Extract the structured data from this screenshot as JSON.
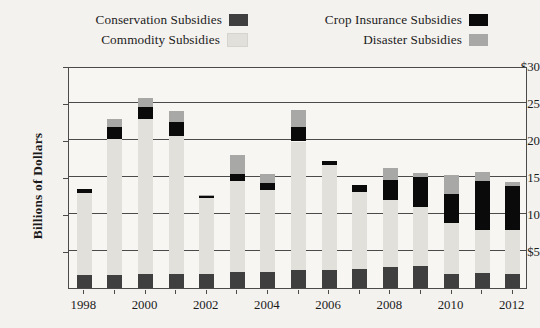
{
  "legend": {
    "entries": [
      {
        "label": "Conservation Subsidies",
        "color": "#3f3f3f",
        "key": "conservation"
      },
      {
        "label": "Crop Insurance Subsidies",
        "color": "#0a0a0a",
        "key": "crop_insurance"
      },
      {
        "label": "Commodity Subsidies",
        "color": "#e2e0da",
        "key": "commodity"
      },
      {
        "label": "Disaster Subsidies",
        "color": "#a8a8a6",
        "key": "disaster"
      }
    ]
  },
  "axes": {
    "ylabel": "Billions of Dollars",
    "yticks": [
      "$5",
      "$10",
      "$15",
      "$20",
      "$25",
      "$30"
    ],
    "xticks": [
      "1998",
      "2000",
      "2002",
      "2004",
      "2006",
      "2008",
      "2010",
      "2012"
    ]
  },
  "chart_data": {
    "type": "bar",
    "title": "",
    "xlabel": "",
    "ylabel": "Billions of Dollars",
    "ylim": [
      0,
      30
    ],
    "grid": true,
    "legend_position": "top",
    "stacked": true,
    "categories": [
      "1998",
      "1999",
      "2000",
      "2001",
      "2002",
      "2003",
      "2004",
      "2005",
      "2006",
      "2007",
      "2008",
      "2009",
      "2010",
      "2011",
      "2012"
    ],
    "series": [
      {
        "name": "Conservation Subsidies",
        "color": "#3f3f3f",
        "values": [
          1.8,
          1.8,
          1.9,
          1.9,
          1.9,
          2.1,
          2.2,
          2.4,
          2.4,
          2.6,
          2.9,
          3.0,
          1.9,
          2.0,
          1.9
        ]
      },
      {
        "name": "Commodity Subsidies",
        "color": "#e2e0da",
        "values": [
          11.0,
          18.3,
          21.0,
          18.6,
          10.2,
          12.3,
          11.1,
          17.4,
          14.2,
          10.4,
          9.0,
          8.0,
          6.9,
          5.8,
          5.9
        ]
      },
      {
        "name": "Crop Insurance Subsidies",
        "color": "#0a0a0a",
        "values": [
          0.6,
          1.7,
          1.5,
          2.0,
          0.4,
          1.0,
          0.9,
          1.9,
          0.6,
          0.9,
          2.7,
          4.0,
          3.9,
          6.6,
          6.0
        ]
      },
      {
        "name": "Disaster Subsidies",
        "color": "#a8a8a6",
        "values": [
          0.0,
          1.1,
          1.3,
          1.4,
          0.1,
          2.6,
          1.2,
          2.4,
          0.0,
          0.0,
          1.6,
          0.5,
          2.6,
          1.3,
          0.5
        ]
      }
    ],
    "totals": [
      13.4,
      22.9,
      25.7,
      23.9,
      12.6,
      18.0,
      15.4,
      24.1,
      17.2,
      13.9,
      16.2,
      15.5,
      15.3,
      15.7,
      14.3
    ]
  }
}
